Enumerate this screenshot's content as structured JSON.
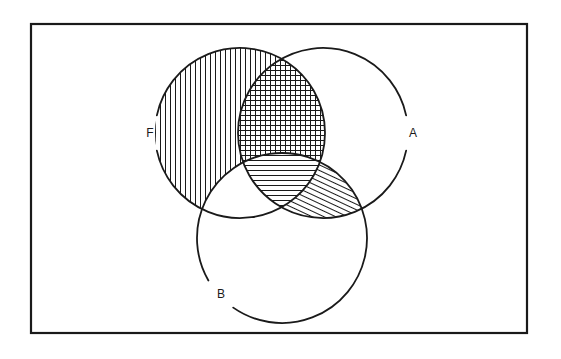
{
  "figure": {
    "kind": "venn-diagram",
    "set_count": 3,
    "background_color": "#ffffff",
    "stroke_color": "#1a1a1a",
    "frame": {
      "name": "outer-frame",
      "x": 31,
      "y": 24,
      "width": 496,
      "height": 309,
      "stroke_width": 2.2
    },
    "circles": [
      {
        "id": "F",
        "label": "F",
        "cx": 240,
        "cy": 133,
        "r": 85,
        "label_x": 150,
        "label_y": 133,
        "gap_deg": [
          168,
          192
        ]
      },
      {
        "id": "A",
        "label": "A",
        "cx": 323,
        "cy": 133,
        "r": 85,
        "label_x": 413,
        "label_y": 133,
        "gap_deg": [
          -12,
          12
        ]
      },
      {
        "id": "B",
        "label": "B",
        "cx": 282,
        "cy": 238,
        "r": 85,
        "label_x": 221,
        "label_y": 294,
        "gap_deg": [
          125,
          150
        ]
      }
    ],
    "regions": [
      {
        "id": "F-only",
        "name": "region-f-only",
        "sets": [
          "F"
        ],
        "fill": "vertical",
        "shaded": true
      },
      {
        "id": "A-only",
        "name": "region-a-only",
        "sets": [
          "A"
        ],
        "fill": "none",
        "shaded": false
      },
      {
        "id": "B-only",
        "name": "region-b-only",
        "sets": [
          "B"
        ],
        "fill": "none",
        "shaded": false
      },
      {
        "id": "FA",
        "name": "region-f-and-a",
        "sets": [
          "F",
          "A"
        ],
        "fill": "grid",
        "shaded": true
      },
      {
        "id": "FB",
        "name": "region-f-and-b",
        "sets": [
          "F",
          "B"
        ],
        "fill": "none",
        "shaded": false
      },
      {
        "id": "AB",
        "name": "region-a-and-b",
        "sets": [
          "A",
          "B"
        ],
        "fill": "diagonal",
        "shaded": true
      },
      {
        "id": "FAB",
        "name": "region-f-a-and-b",
        "sets": [
          "F",
          "A",
          "B"
        ],
        "fill": "horizontal",
        "shaded": true
      }
    ],
    "hatch": {
      "spacing_px": 5,
      "line_width": 1.0,
      "diagonal_angle_deg": 65
    }
  }
}
